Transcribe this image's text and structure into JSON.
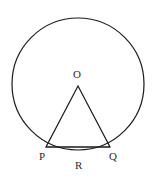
{
  "figure": {
    "background_color": "#ffffff",
    "stroke_color": "#1a1a1a",
    "label_color": "#2b2b2b",
    "canvas": {
      "width": 156,
      "height": 179
    },
    "circle": {
      "name": "circumscribed-circle",
      "center_x": 78,
      "center_y": 84,
      "radius": 66,
      "stroke_width": 1.2
    },
    "triangle": {
      "name": "inscribed-triangle",
      "points": "78,86 46,147 110,147",
      "stroke_width": 1.2,
      "apex": {
        "x": 78,
        "y": 86
      },
      "left_vertex": {
        "x": 46,
        "y": 147
      },
      "right_vertex": {
        "x": 110,
        "y": 147
      }
    },
    "chord": {
      "name": "chord-pq",
      "x1": 46,
      "y1": 147,
      "x2": 110,
      "y2": 147,
      "stroke_width": 1.2
    },
    "labels": {
      "center": "O",
      "left": "P",
      "right": "Q",
      "arc": "R"
    }
  }
}
